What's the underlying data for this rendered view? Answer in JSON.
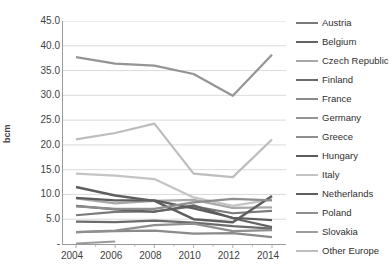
{
  "chart_data": {
    "type": "line",
    "title": "",
    "xlabel": "",
    "ylabel": "bcm",
    "x": [
      2004,
      2006,
      2008,
      2010,
      2012,
      2014
    ],
    "xticklabels": [
      "2004",
      "2006",
      "2008",
      "2010",
      "2012",
      "2014"
    ],
    "yticklabels": [
      "45.0",
      "40.0",
      "35.0",
      "30.0",
      "25.0",
      "20.0",
      "15.0",
      "10.0",
      "5.0",
      "-"
    ],
    "yticks": [
      45.0,
      40.0,
      35.0,
      30.0,
      25.0,
      20.0,
      15.0,
      10.0,
      5.0,
      0.0
    ],
    "ylim": [
      0.0,
      45.0
    ],
    "grid": "horizontal",
    "legend_position": "right",
    "series": [
      {
        "name": "Austria",
        "color": "#7a7a7a",
        "width": 2.2,
        "values": [
          5.8,
          6.5,
          6.6,
          7.6,
          6.2,
          6.7
        ]
      },
      {
        "name": "Belgium",
        "color": "#636363",
        "width": 2.2,
        "values": [
          7.7,
          7.0,
          6.5,
          7.8,
          5.2,
          3.4
        ]
      },
      {
        "name": "Czech Republic",
        "color": "#a8a8a8",
        "width": 2.2,
        "values": [
          9.2,
          8.2,
          8.7,
          8.9,
          7.3,
          7.4
        ]
      },
      {
        "name": "Finland",
        "color": "#6b6b6b",
        "width": 2.2,
        "values": [
          4.5,
          4.4,
          4.7,
          4.3,
          3.6,
          3.1
        ]
      },
      {
        "name": "France",
        "color": "#8a8a8a",
        "width": 2.2,
        "values": [
          2.4,
          2.6,
          2.7,
          2.1,
          2.2,
          1.4
        ]
      },
      {
        "name": "Germany",
        "color": "#949494",
        "width": 2.2,
        "values": [
          37.7,
          36.4,
          36.0,
          34.3,
          29.9,
          38.2
        ]
      },
      {
        "name": "Greece",
        "color": "#8f8f8f",
        "width": 2.2,
        "values": [
          2.4,
          2.7,
          3.8,
          4.1,
          2.6,
          2.8
        ]
      },
      {
        "name": "Hungary",
        "color": "#5c5c5c",
        "width": 2.2,
        "values": [
          9.3,
          8.8,
          8.8,
          7.2,
          5.3,
          4.8
        ]
      },
      {
        "name": "Italy",
        "color": "#c4c4c4",
        "width": 2.2,
        "values": [
          14.2,
          13.8,
          13.1,
          9.4,
          7.7,
          9.0
        ]
      },
      {
        "name": "Netherlands",
        "color": "#5e5e5e",
        "width": 2.5,
        "values": [
          11.5,
          9.8,
          8.7,
          5.0,
          4.4,
          9.7
        ]
      },
      {
        "name": "Poland",
        "color": "#8e8e8e",
        "width": 2.2,
        "values": [
          7.6,
          7.1,
          7.1,
          8.4,
          9.1,
          8.8
        ]
      },
      {
        "name": "Slovakia",
        "color": "#9c9c9c",
        "width": 2.2,
        "values": [
          0.1,
          0.5,
          null,
          null,
          null,
          null
        ]
      },
      {
        "name": "Other Europe",
        "color": "#bdbdbd",
        "width": 2.2,
        "values": [
          21.1,
          22.4,
          24.3,
          14.2,
          13.5,
          21.1
        ]
      }
    ]
  },
  "legend": {
    "items": [
      {
        "label": "Austria"
      },
      {
        "label": "Belgium"
      },
      {
        "label": "Czech Republic"
      },
      {
        "label": "Finland"
      },
      {
        "label": "France"
      },
      {
        "label": "Germany"
      },
      {
        "label": "Greece"
      },
      {
        "label": "Hungary"
      },
      {
        "label": "Italy"
      },
      {
        "label": "Netherlands"
      },
      {
        "label": "Poland"
      },
      {
        "label": "Slovakia"
      },
      {
        "label": "Other Europe"
      }
    ]
  },
  "style": {
    "grid_color": "#d0d0d0",
    "axis_color": "#9a9a9a",
    "text_color": "#3f3f3f",
    "background": "#ffffff"
  }
}
